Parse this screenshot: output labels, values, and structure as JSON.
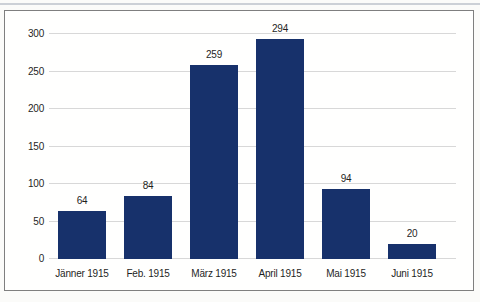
{
  "chart_data": {
    "type": "bar",
    "title": "",
    "xlabel": "",
    "ylabel": "",
    "categories": [
      "Jänner 1915",
      "Feb. 1915",
      "März 1915",
      "April 1915",
      "Mai 1915",
      "Juni 1915"
    ],
    "values": [
      64,
      84,
      259,
      294,
      94,
      20
    ],
    "ylim": [
      0,
      300
    ],
    "yticks": [
      0,
      50,
      100,
      150,
      200,
      250,
      300
    ],
    "grid": true,
    "legend": false,
    "bar_color": "#17316b",
    "grid_color": "#d8d8d8",
    "frame_border_color": "#7f7f7f",
    "label_color": "#1f1f1f"
  },
  "layout": {
    "px_per_unit": 0.75,
    "bar_width": 48,
    "slot_width": 66,
    "first_center": 33
  }
}
